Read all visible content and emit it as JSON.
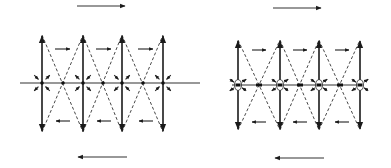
{
  "figure": {
    "panels": [
      {
        "id": "left",
        "label": "",
        "baseline": {
          "x1": 20,
          "x2": 200,
          "y": 83
        },
        "verticals": [
          42,
          83,
          122,
          163
        ],
        "vertical_top": 35,
        "vertical_bottom": 132,
        "vertical_arrowheads": [
          {
            "x": 42,
            "dir": "up"
          },
          {
            "x": 83,
            "dir": "down"
          },
          {
            "x": 122,
            "dir": "up"
          },
          {
            "x": 163,
            "dir": "down"
          }
        ],
        "dashed_crossings": [
          63,
          103,
          143
        ],
        "top_flow_arrows": [
          {
            "x1": 55,
            "x2": 70,
            "y": 49
          },
          {
            "x1": 96,
            "x2": 111,
            "y": 49
          },
          {
            "x1": 138,
            "x2": 153,
            "y": 49
          }
        ],
        "bottom_flow_arrows": [
          {
            "x1": 70,
            "x2": 56,
            "y": 121
          },
          {
            "x1": 111,
            "x2": 97,
            "y": 121
          },
          {
            "x1": 153,
            "x2": 139,
            "y": 121
          }
        ],
        "outer_top_arrow": {
          "x1": 77,
          "x2": 125,
          "y": 6,
          "dir": "right"
        },
        "outer_bottom_arrow": {
          "x1": 127,
          "x2": 78,
          "y": 157,
          "dir": "left"
        },
        "style": "crossing-dots"
      },
      {
        "id": "right",
        "label": "",
        "baseline": {
          "x1": 232,
          "x2": 362,
          "y": 85
        },
        "verticals": [
          238,
          280,
          319,
          360
        ],
        "vertical_top": 40,
        "vertical_bottom": 130,
        "dashed_crossings": [
          259,
          300,
          340
        ],
        "top_flow_arrows": [
          {
            "x1": 252,
            "x2": 266,
            "y": 50
          },
          {
            "x1": 293,
            "x2": 307,
            "y": 50
          },
          {
            "x1": 335,
            "x2": 349,
            "y": 50
          }
        ],
        "bottom_flow_arrows": [
          {
            "x1": 266,
            "x2": 252,
            "y": 122
          },
          {
            "x1": 307,
            "x2": 293,
            "y": 122
          },
          {
            "x1": 349,
            "x2": 335,
            "y": 122
          }
        ],
        "outer_top_arrow": {
          "x1": 273,
          "x2": 321,
          "y": 8,
          "dir": "right"
        },
        "outer_bottom_arrow": {
          "x1": 324,
          "x2": 275,
          "y": 158,
          "dir": "left"
        },
        "style": "ellipse-nodes"
      }
    ],
    "stroke_color": "#1a1a1a",
    "background": "#ffffff"
  }
}
